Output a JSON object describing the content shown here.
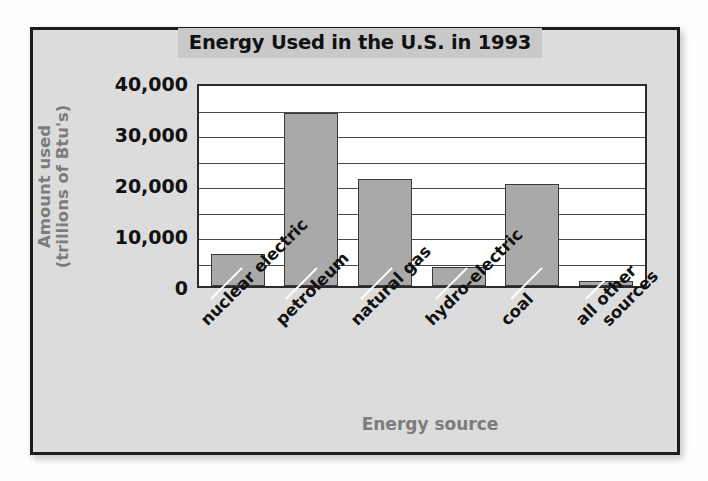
{
  "figure": {
    "title": "Energy Used in the U.S. in 1993",
    "frame_color": "#1c1c1c",
    "background_color": "#dcdcdc",
    "title_band_color": "#c9c9c9",
    "bar_fill_color": "#a9a9a9",
    "bar_border_color": "#3a3a3a",
    "axis_title_color": "#7c7c7c"
  },
  "chart_data": {
    "type": "bar",
    "title": "Energy Used in the U.S. in 1993",
    "xlabel": "Energy source",
    "ylabel": "Amount used (trillions of Btu's)",
    "ylabel_line1": "Amount used",
    "ylabel_line2": "(trillions of Btu's)",
    "categories": [
      "nuclear electric",
      "petroleum",
      "natural gas",
      "hydro-electric",
      "coal",
      "all other sources"
    ],
    "values": [
      6200,
      34000,
      21000,
      3700,
      20000,
      900
    ],
    "ylim": [
      0,
      40000
    ],
    "ytick_labels": [
      "0",
      "10,000",
      "20,000",
      "30,000",
      "40,000"
    ],
    "ytick_values": [
      0,
      10000,
      20000,
      30000,
      40000
    ],
    "gridline_interval": 5000,
    "gridline_values": [
      5000,
      10000,
      15000,
      20000,
      25000,
      30000,
      35000,
      40000
    ],
    "grid": true,
    "legend": "none",
    "bar_color": "#a9a9a9"
  }
}
